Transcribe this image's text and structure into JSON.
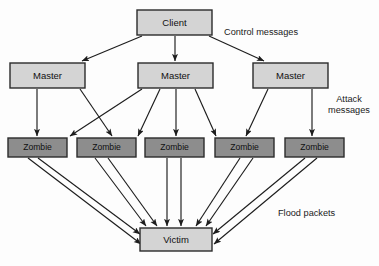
{
  "diagram": {
    "colors": {
      "light_fill": "#d4d4d4",
      "dark_fill": "#8d8d8d",
      "stroke": "#2b2b2b",
      "arrow": "#1d1d1d",
      "background": "#fdfdfd",
      "text": "#101010"
    },
    "nodes": {
      "client": {
        "label": "Client",
        "x": 137,
        "y": 10,
        "w": 75,
        "h": 25,
        "fill": "light"
      },
      "masters": [
        {
          "label": "Master",
          "x": 10,
          "y": 63,
          "w": 75,
          "h": 25,
          "fill": "light"
        },
        {
          "label": "Master",
          "x": 138,
          "y": 63,
          "w": 75,
          "h": 25,
          "fill": "light"
        },
        {
          "label": "Master",
          "x": 253,
          "y": 63,
          "w": 75,
          "h": 25,
          "fill": "light"
        }
      ],
      "zombies": [
        {
          "label": "Zombie",
          "x": 8,
          "y": 138,
          "w": 59,
          "h": 19,
          "fill": "dark"
        },
        {
          "label": "Zombie",
          "x": 77,
          "y": 138,
          "w": 59,
          "h": 19,
          "fill": "dark"
        },
        {
          "label": "Zombie",
          "x": 145,
          "y": 138,
          "w": 59,
          "h": 19,
          "fill": "dark"
        },
        {
          "label": "Zombie",
          "x": 215,
          "y": 138,
          "w": 59,
          "h": 19,
          "fill": "dark"
        },
        {
          "label": "Zombie",
          "x": 285,
          "y": 138,
          "w": 59,
          "h": 19,
          "fill": "dark"
        }
      ],
      "victim": {
        "label": "Victim",
        "x": 140,
        "y": 228,
        "w": 72,
        "h": 23,
        "fill": "light"
      }
    },
    "annotations": [
      {
        "name": "control-messages-label",
        "lines": [
          "Control messages"
        ],
        "x": 224,
        "y": 35,
        "align": "start"
      },
      {
        "name": "attack-messages-label",
        "lines": [
          "Attack",
          "messages"
        ],
        "x": 349,
        "y": 102,
        "align": "middle"
      },
      {
        "name": "flood-packets-label",
        "lines": [
          "Flood packets"
        ],
        "x": 278,
        "y": 216,
        "align": "start"
      }
    ],
    "edges": {
      "client_to_masters": [
        {
          "from": "client",
          "to": "master-1",
          "x1": 142,
          "y1": 36,
          "x2": 82,
          "y2": 61
        },
        {
          "from": "client",
          "to": "master-2",
          "x1": 175,
          "y1": 36,
          "x2": 175,
          "y2": 61
        },
        {
          "from": "client",
          "to": "master-3",
          "x1": 209,
          "y1": 36,
          "x2": 264,
          "y2": 61
        }
      ],
      "masters_to_zombies": [
        {
          "from": "master-1",
          "to": "zombie-1",
          "x1": 37,
          "y1": 89,
          "x2": 37,
          "y2": 136
        },
        {
          "from": "master-1",
          "to": "zombie-3",
          "x1": 80,
          "y1": 89,
          "x2": 112,
          "y2": 136
        },
        {
          "from": "master-2",
          "to": "zombie-2",
          "x1": 142,
          "y1": 89,
          "x2": 70,
          "y2": 136
        },
        {
          "from": "master-2",
          "to": "zombie-3",
          "x1": 160,
          "y1": 89,
          "x2": 138,
          "y2": 136
        },
        {
          "from": "master-2",
          "to": "zombie-4",
          "x1": 176,
          "y1": 89,
          "x2": 176,
          "y2": 136
        },
        {
          "from": "master-2",
          "to": "zombie-5",
          "x1": 195,
          "y1": 89,
          "x2": 216,
          "y2": 136
        },
        {
          "from": "master-3",
          "to": "zombie-4",
          "x1": 268,
          "y1": 89,
          "x2": 246,
          "y2": 136
        },
        {
          "from": "master-3",
          "to": "zombie-5",
          "x1": 312,
          "y1": 89,
          "x2": 312,
          "y2": 136
        }
      ],
      "zombies_to_victim": [
        {
          "from": "zombie-1",
          "to": "victim",
          "x1": 28,
          "y1": 158,
          "x2": 141,
          "y2": 244
        },
        {
          "from": "zombie-1",
          "to": "victim",
          "x1": 38,
          "y1": 158,
          "x2": 140,
          "y2": 234
        },
        {
          "from": "zombie-2",
          "to": "victim",
          "x1": 95,
          "y1": 158,
          "x2": 146,
          "y2": 226
        },
        {
          "from": "zombie-2",
          "to": "victim",
          "x1": 108,
          "y1": 158,
          "x2": 157,
          "y2": 226
        },
        {
          "from": "zombie-3",
          "to": "victim",
          "x1": 167,
          "y1": 158,
          "x2": 167,
          "y2": 226
        },
        {
          "from": "zombie-3",
          "to": "victim",
          "x1": 181,
          "y1": 158,
          "x2": 181,
          "y2": 226
        },
        {
          "from": "zombie-4",
          "to": "victim",
          "x1": 240,
          "y1": 158,
          "x2": 196,
          "y2": 226
        },
        {
          "from": "zombie-4",
          "to": "victim",
          "x1": 253,
          "y1": 158,
          "x2": 206,
          "y2": 226
        },
        {
          "from": "zombie-5",
          "to": "victim",
          "x1": 305,
          "y1": 158,
          "x2": 213,
          "y2": 234
        },
        {
          "from": "zombie-5",
          "to": "victim",
          "x1": 317,
          "y1": 158,
          "x2": 214,
          "y2": 244
        }
      ]
    }
  }
}
